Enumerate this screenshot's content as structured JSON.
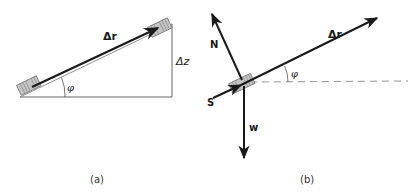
{
  "panel_a": {
    "caption": "(a)",
    "labels": {
      "displacement": "Δr",
      "height": "Δz",
      "angle": "φ"
    }
  },
  "panel_b": {
    "caption": "(b)",
    "labels": {
      "displacement": "Δr",
      "normal_force": "N",
      "force_s": "S",
      "weight": "w",
      "angle": "φ"
    }
  },
  "colors": {
    "line": "#1a1a1a",
    "thin_line": "#555555",
    "block_fill": "#bdbdbd",
    "dashed": "#777777"
  }
}
